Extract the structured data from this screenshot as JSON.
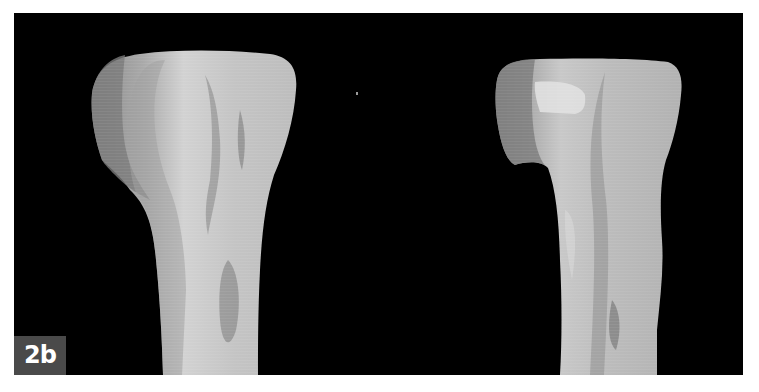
{
  "figure": {
    "label": "2b",
    "background_color": "#000000",
    "label_box_color": "#4a4a4a",
    "label_text_color": "#ffffff"
  },
  "specimens": [
    {
      "name": "left-bone-render",
      "view": "anterior"
    },
    {
      "name": "right-bone-render",
      "view": "lateral"
    }
  ]
}
